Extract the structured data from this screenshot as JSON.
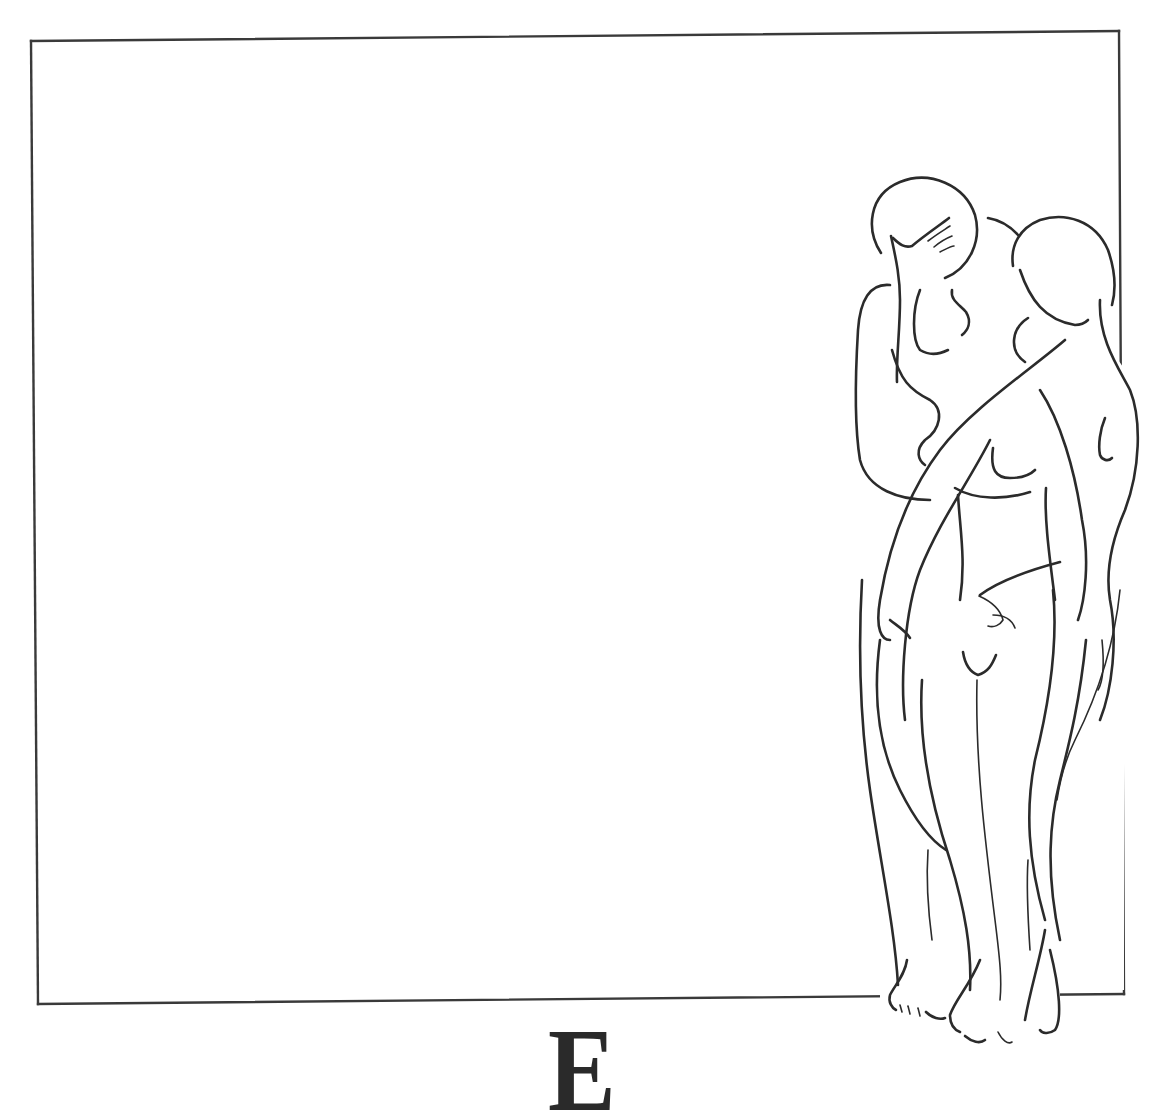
{
  "illustration": {
    "style": "line drawing",
    "subject": "two standing nude figures embracing beside a frame",
    "stroke_color": "#2b2b2b",
    "background_color": "#ffffff",
    "frame": {
      "color": "#3a3a3a",
      "top_left": [
        31,
        41
      ],
      "top_right": [
        1119,
        31
      ],
      "bottom_right": [
        1124,
        994
      ],
      "bottom_left": [
        38,
        1004
      ]
    }
  },
  "drop_cap": {
    "letter": "E"
  }
}
